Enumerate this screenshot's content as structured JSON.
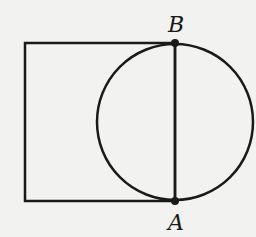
{
  "diagram": {
    "type": "geometry",
    "colors": {
      "background": "#f2f2f0",
      "stroke": "#1a1a1a"
    },
    "rectangle": {
      "x": 25,
      "y": 43,
      "width": 150,
      "height": 158
    },
    "circle": {
      "cx": 175,
      "cy": 122,
      "r": 78
    },
    "segment_AB": {
      "x1": 175,
      "y1": 43,
      "x2": 175,
      "y2": 201
    },
    "points": [
      {
        "name": "B",
        "x": 175,
        "y": 43,
        "label_x": 168,
        "label_y": 32
      },
      {
        "name": "A",
        "x": 175,
        "y": 201,
        "label_x": 168,
        "label_y": 230
      }
    ]
  }
}
